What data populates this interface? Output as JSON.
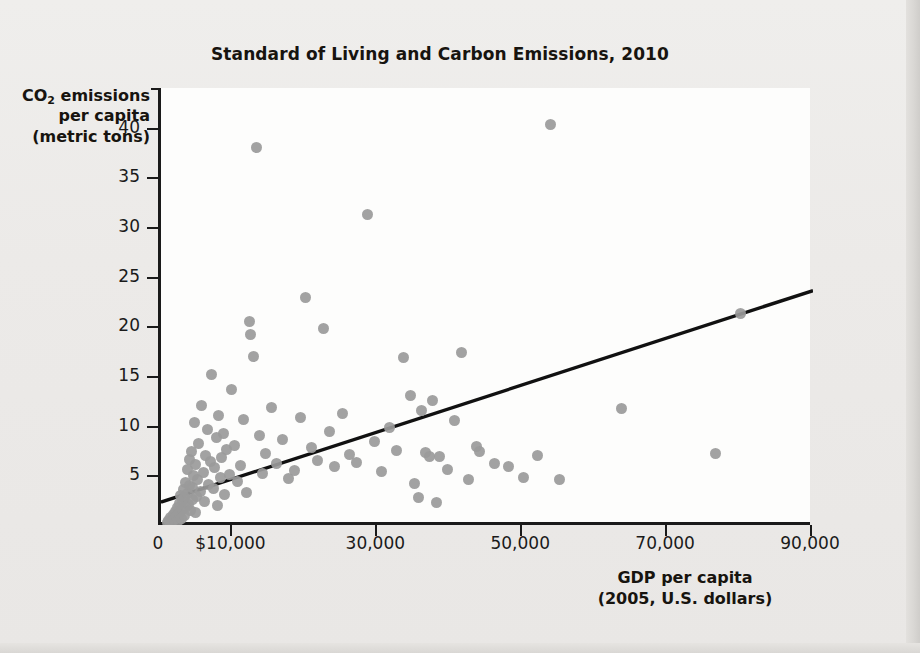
{
  "chart_data": {
    "type": "scatter",
    "title": "Standard of Living and Carbon Emissions, 2010",
    "xlabel": "GDP per capita",
    "xlabel_sub": "(2005, U.S. dollars)",
    "ylabel_line1": "CO2 emissions",
    "ylabel_line2": "per capita",
    "ylabel_line3": "(metric tons)",
    "ylabel_subscript": "2",
    "ylabel_prefix": "CO",
    "ylabel_suffix": " emissions",
    "xlim": [
      0,
      90000
    ],
    "ylim": [
      0,
      44
    ],
    "xticks": [
      0,
      10000,
      30000,
      50000,
      70000,
      90000
    ],
    "xtick_labels": [
      "0",
      "$10,000",
      "30,000",
      "50,000",
      "70,000",
      "90,000"
    ],
    "yticks": [
      5,
      10,
      15,
      20,
      25,
      30,
      35,
      40
    ],
    "ytick_labels": [
      "5",
      "10",
      "15",
      "20",
      "25",
      "30",
      "35",
      "40"
    ],
    "grid": false,
    "legend": "none",
    "marker_color": "#9a9a9a",
    "trendline_color": "#111111",
    "trendline": {
      "label": "linear fit",
      "x0": 0,
      "y0": 2.3,
      "x1": 90000,
      "y1": 23.6
    },
    "points": [
      [
        900,
        0.3
      ],
      [
        1100,
        0.5
      ],
      [
        1300,
        0.8
      ],
      [
        1500,
        0.4
      ],
      [
        1700,
        1.1
      ],
      [
        1900,
        0.6
      ],
      [
        2000,
        1.4
      ],
      [
        2100,
        0.9
      ],
      [
        2300,
        1.8
      ],
      [
        2400,
        0.5
      ],
      [
        2500,
        2.2
      ],
      [
        2600,
        1.2
      ],
      [
        2700,
        3.0
      ],
      [
        2800,
        0.7
      ],
      [
        2900,
        2.5
      ],
      [
        3000,
        1.6
      ],
      [
        3100,
        3.6
      ],
      [
        3200,
        1.0
      ],
      [
        3300,
        2.8
      ],
      [
        3400,
        4.3
      ],
      [
        3500,
        1.9
      ],
      [
        3600,
        5.6
      ],
      [
        3700,
        3.2
      ],
      [
        3800,
        2.1
      ],
      [
        3900,
        6.6
      ],
      [
        4000,
        4.0
      ],
      [
        4100,
        1.5
      ],
      [
        4200,
        7.4
      ],
      [
        4300,
        2.6
      ],
      [
        4400,
        3.8
      ],
      [
        4500,
        5.0
      ],
      [
        4600,
        10.3
      ],
      [
        4700,
        1.3
      ],
      [
        4800,
        6.1
      ],
      [
        4900,
        2.9
      ],
      [
        5000,
        4.6
      ],
      [
        5200,
        8.2
      ],
      [
        5400,
        3.4
      ],
      [
        5600,
        12.0
      ],
      [
        5800,
        5.3
      ],
      [
        6000,
        2.4
      ],
      [
        6200,
        7.0
      ],
      [
        6400,
        9.6
      ],
      [
        6600,
        4.1
      ],
      [
        6800,
        6.4
      ],
      [
        7000,
        15.2
      ],
      [
        7200,
        3.7
      ],
      [
        7400,
        5.8
      ],
      [
        7600,
        8.8
      ],
      [
        7800,
        2.0
      ],
      [
        8000,
        11.0
      ],
      [
        8200,
        4.8
      ],
      [
        8400,
        6.8
      ],
      [
        8600,
        9.2
      ],
      [
        8800,
        3.1
      ],
      [
        9000,
        7.6
      ],
      [
        9400,
        5.1
      ],
      [
        9800,
        13.6
      ],
      [
        10200,
        8.0
      ],
      [
        10600,
        4.4
      ],
      [
        11000,
        6.0
      ],
      [
        11400,
        10.6
      ],
      [
        11800,
        3.3
      ],
      [
        12200,
        20.5
      ],
      [
        12400,
        19.2
      ],
      [
        12800,
        17.0
      ],
      [
        13200,
        38.0
      ],
      [
        13600,
        9.0
      ],
      [
        14000,
        5.2
      ],
      [
        14400,
        7.2
      ],
      [
        15200,
        11.8
      ],
      [
        16000,
        6.2
      ],
      [
        16800,
        8.6
      ],
      [
        17600,
        4.7
      ],
      [
        18400,
        5.5
      ],
      [
        19200,
        10.8
      ],
      [
        20000,
        22.9
      ],
      [
        20800,
        7.8
      ],
      [
        21600,
        6.5
      ],
      [
        22400,
        19.8
      ],
      [
        23200,
        9.4
      ],
      [
        24000,
        5.9
      ],
      [
        25000,
        11.2
      ],
      [
        26000,
        7.1
      ],
      [
        27000,
        6.3
      ],
      [
        28500,
        31.3
      ],
      [
        29500,
        8.4
      ],
      [
        30500,
        5.4
      ],
      [
        31500,
        9.8
      ],
      [
        32500,
        7.5
      ],
      [
        33500,
        16.9
      ],
      [
        34500,
        13.0
      ],
      [
        35000,
        4.2
      ],
      [
        35500,
        2.8
      ],
      [
        36000,
        11.5
      ],
      [
        36500,
        7.3
      ],
      [
        37000,
        6.9
      ],
      [
        37500,
        12.5
      ],
      [
        38000,
        2.3
      ],
      [
        38500,
        6.9
      ],
      [
        39500,
        5.6
      ],
      [
        40500,
        10.5
      ],
      [
        41500,
        17.4
      ],
      [
        42500,
        4.6
      ],
      [
        43500,
        7.9
      ],
      [
        44000,
        7.4
      ],
      [
        46000,
        6.2
      ],
      [
        48000,
        5.9
      ],
      [
        50000,
        4.8
      ],
      [
        52000,
        7.0
      ],
      [
        53800,
        40.3
      ],
      [
        55000,
        4.6
      ],
      [
        63500,
        11.7
      ],
      [
        76500,
        7.2
      ],
      [
        80000,
        21.3
      ]
    ]
  }
}
